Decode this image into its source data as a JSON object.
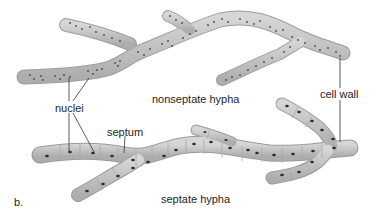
{
  "figure": {
    "panel_label": "b.",
    "labels": {
      "nuclei": "nuclei",
      "nonseptate": "nonseptate hypha",
      "cell_wall": "cell wall",
      "septum": "septum",
      "septate": "septate hypha"
    },
    "colors": {
      "hypha_fill": "#c4c4c4",
      "hypha_edge": "#9a9a9a",
      "nucleus": "#2a2a2a",
      "septum_line": "#a8a8a8",
      "leader_line": "#333333",
      "text": "#1e1e1e"
    }
  }
}
